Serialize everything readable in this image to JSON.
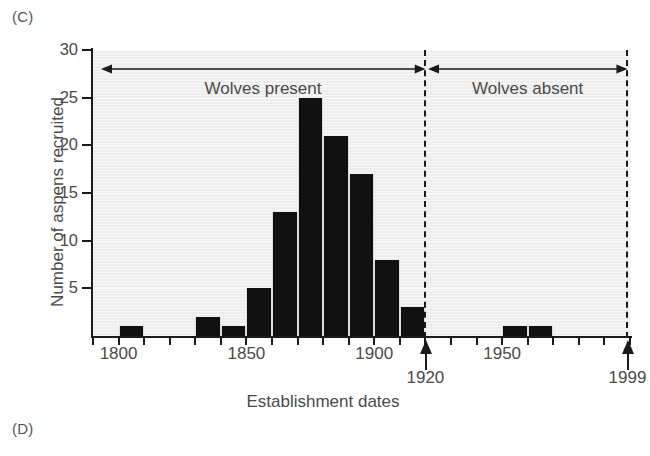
{
  "panels": {
    "current": "(C)",
    "next": "(D)"
  },
  "chart_data": {
    "type": "bar",
    "title": "",
    "subtitle": "",
    "xlabel": "Establishment dates",
    "ylabel": "Number of aspens recruited",
    "xlim": [
      1790,
      2000
    ],
    "ylim": [
      0,
      30
    ],
    "grid": false,
    "legend_position": "none",
    "bar_width_years": 10,
    "x_tick_labels": [
      "1800",
      "1850",
      "1900",
      "1950"
    ],
    "x_tick_values": [
      1800,
      1850,
      1900,
      1950
    ],
    "x_minor_tick_values": [
      1790,
      1800,
      1810,
      1820,
      1830,
      1840,
      1850,
      1860,
      1870,
      1880,
      1890,
      1900,
      1910,
      1920,
      1930,
      1940,
      1950,
      1960,
      1970,
      1980,
      1990,
      2000
    ],
    "y_tick_labels": [
      "5",
      "10",
      "15",
      "20",
      "25",
      "30"
    ],
    "y_tick_values": [
      5,
      10,
      15,
      20,
      25,
      30
    ],
    "categories": [
      "1800",
      "1810",
      "1820",
      "1830",
      "1840",
      "1850",
      "1860",
      "1870",
      "1880",
      "1890",
      "1900",
      "1910",
      "1920",
      "1930",
      "1940",
      "1950",
      "1960",
      "1970",
      "1980",
      "1990"
    ],
    "values": [
      1,
      0,
      0,
      2,
      1,
      5,
      13,
      25,
      21,
      17,
      8,
      3,
      0,
      0,
      0,
      1,
      1,
      0,
      0,
      0
    ],
    "bar_color": "#111111",
    "plot_background": "#ececec",
    "annotations": [
      {
        "name": "wolves-present",
        "label": "Wolves present",
        "type": "double-arrow",
        "x_start": 1793,
        "x_end": 1920,
        "y": 28
      },
      {
        "name": "wolves-absent",
        "label": "Wolves absent",
        "type": "double-arrow",
        "x_start": 1921,
        "x_end": 1999,
        "y": 28
      },
      {
        "name": "divider-1920",
        "label": "1920",
        "type": "dashed-line-callout",
        "x": 1920
      },
      {
        "name": "divider-1999",
        "label": "1999",
        "type": "dashed-line-callout",
        "x": 1999
      }
    ]
  },
  "axis": {
    "y_title": "Number of aspens recruited",
    "x_title": "Establishment dates"
  },
  "eras": {
    "present_label": "Wolves present",
    "absent_label": "Wolves absent"
  },
  "callouts": {
    "wolf_removal_year": "1920",
    "survey_year": "1999"
  }
}
